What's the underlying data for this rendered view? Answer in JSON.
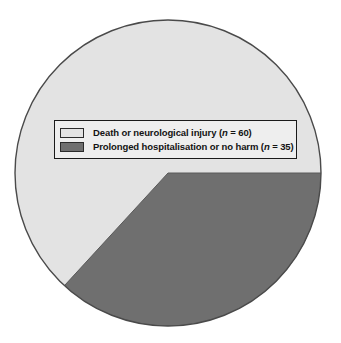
{
  "chart_data": {
    "type": "pie",
    "title": "",
    "subtitle": "",
    "xlabel": "",
    "ylabel": "",
    "grid": false,
    "legend_position": "center-overlay",
    "total": 95,
    "categories": [
      "Death or neurological injury",
      "Prolonged hospitalisation or no harm"
    ],
    "values": [
      60,
      35
    ],
    "percentages": [
      63.2,
      36.8
    ],
    "colors": [
      "#e3e3e3",
      "#6f6f6f"
    ],
    "slices": [
      {
        "label": "Death or neurological injury",
        "n": 60,
        "value": 60,
        "percent": 63.2,
        "color": "#e3e3e3",
        "start_angle_deg": 132.6,
        "end_angle_deg": 360.0
      },
      {
        "label": "Prolonged hospitalisation or no harm",
        "n": 35,
        "value": 35,
        "percent": 36.8,
        "color": "#6f6f6f",
        "start_angle_deg": 0.0,
        "end_angle_deg": 132.6
      }
    ]
  },
  "legend": {
    "items": [
      {
        "label_prefix": "Death or neurological injury (",
        "n_symbol": "n",
        "label_suffix": " = 60)",
        "swatch_color": "#e3e3e3"
      },
      {
        "label_prefix": "Prolonged hospitalisation or no harm (",
        "n_symbol": "n",
        "label_suffix": " = 35)",
        "swatch_color": "#6f6f6f"
      }
    ]
  },
  "figure": {
    "background": "#ffffff",
    "outline_color": "#4a4a4a",
    "center_x": 168,
    "center_y": 173,
    "radius": 153
  }
}
